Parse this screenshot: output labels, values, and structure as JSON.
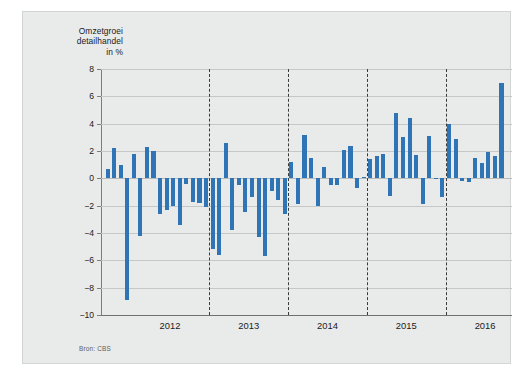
{
  "chart_data": {
    "type": "bar",
    "title": "Omzetgroei detailhandel in %",
    "title_lines": [
      "Omzetgroei",
      "detailhandel",
      "in %"
    ],
    "xlabel": "",
    "ylabel": "%",
    "ylim": [
      -10,
      8
    ],
    "yticks": [
      8,
      6,
      4,
      2,
      0,
      -2,
      -4,
      -6,
      -8,
      -10
    ],
    "ytick_labels": [
      "8",
      "6",
      "4",
      "2",
      "0",
      "−2",
      "−4",
      "−6",
      "−8",
      "−10"
    ],
    "grid": true,
    "legend": null,
    "source": "Bron: CBS",
    "bar_color": "#2f75b5",
    "background_color": "#e9eaea",
    "year_separators": [
      2012.5,
      2013.5,
      2014.5,
      2015.5
    ],
    "categories": [
      "2011-09",
      "2011-10",
      "2011-11",
      "2011-12",
      "2012-01",
      "2012-02",
      "2012-03",
      "2012-04",
      "2012-05",
      "2012-06",
      "2012-07",
      "2012-08",
      "2012-09",
      "2012-10",
      "2012-11",
      "2012-12",
      "2013-01",
      "2013-02",
      "2013-03",
      "2013-04",
      "2013-05",
      "2013-06",
      "2013-07",
      "2013-08",
      "2013-09",
      "2013-10",
      "2013-11",
      "2013-12",
      "2014-01",
      "2014-02",
      "2014-03",
      "2014-04",
      "2014-05",
      "2014-06",
      "2014-07",
      "2014-08",
      "2014-09",
      "2014-10",
      "2014-11",
      "2014-12",
      "2015-01",
      "2015-02",
      "2015-03",
      "2015-04",
      "2015-05",
      "2015-06",
      "2015-07",
      "2015-08",
      "2015-09",
      "2015-10",
      "2015-11",
      "2015-12",
      "2016-01",
      "2016-02",
      "2016-03",
      "2016-04",
      "2016-05",
      "2016-06",
      "2016-07",
      "2016-08",
      "2016-09"
    ],
    "values": [
      0.7,
      2.2,
      1.0,
      -8.9,
      1.8,
      -4.2,
      2.3,
      2.0,
      -2.6,
      -2.3,
      -2.0,
      -3.4,
      -0.4,
      -1.7,
      -1.8,
      -2.1,
      -5.2,
      -5.6,
      2.6,
      -3.8,
      -0.5,
      -2.5,
      -1.4,
      -4.3,
      -5.7,
      -0.9,
      -1.6,
      -2.6,
      1.2,
      -1.9,
      3.2,
      1.5,
      -2.0,
      0.8,
      -0.5,
      -0.5,
      2.1,
      2.4,
      -0.7,
      0.1,
      1.4,
      1.6,
      1.8,
      -1.3,
      4.8,
      3.0,
      4.4,
      1.7,
      -1.9,
      3.1,
      0.0,
      -1.4,
      4.0,
      2.9,
      -0.2,
      -0.3,
      1.5,
      1.1,
      1.9,
      1.6,
      7.0
    ],
    "xticks": [
      2012,
      2013,
      2014,
      2015,
      2016
    ],
    "xtick_labels": [
      "2012",
      "2013",
      "2014",
      "2015",
      "2016"
    ]
  }
}
